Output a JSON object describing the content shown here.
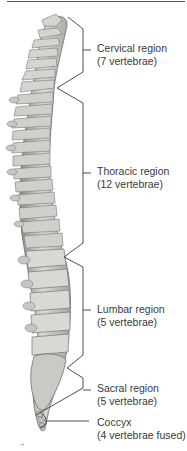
{
  "figure": {
    "regions": [
      {
        "name": "Cervical region",
        "count": "(7 vertebrae)"
      },
      {
        "name": "Thoracic region",
        "count": "(12 vertebrae)"
      },
      {
        "name": "Lumbar region",
        "count": "(5 vertebrae)"
      },
      {
        "name": "Sacral region",
        "count": "(5 vertebrae)"
      },
      {
        "name": "Coccyx",
        "count": "(4 vertebrae fused)"
      }
    ],
    "colors": {
      "bone_light": "#e2e2e0",
      "bone_mid": "#b9b9b6",
      "bone_dark": "#7d7d7a",
      "line": "#3a3a3a"
    }
  }
}
